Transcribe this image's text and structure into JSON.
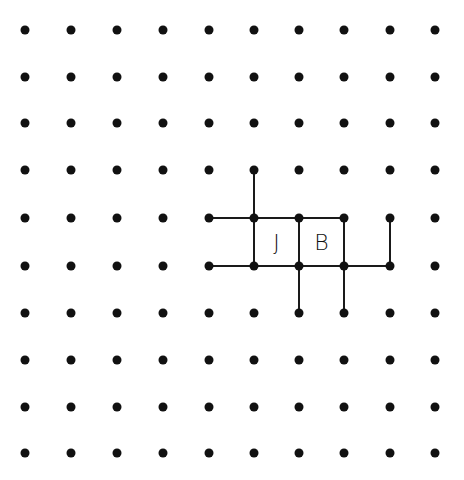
{
  "game": {
    "type": "dots-and-boxes",
    "grid": {
      "cols": 10,
      "rows": 10
    },
    "col_x": [
      25,
      71,
      117,
      163,
      209,
      254,
      299,
      344,
      390,
      435
    ],
    "row_y": [
      30,
      77,
      123,
      170,
      218,
      266,
      313,
      360,
      407,
      453
    ],
    "colors": {
      "dot": "#111111",
      "line": "#1a1a1a",
      "background": "#ffffff"
    },
    "lines": [
      {
        "orientation": "v",
        "col": 5,
        "row": 3
      },
      {
        "orientation": "h",
        "col": 4,
        "row": 4
      },
      {
        "orientation": "h",
        "col": 5,
        "row": 4
      },
      {
        "orientation": "h",
        "col": 6,
        "row": 4
      },
      {
        "orientation": "h",
        "col": 4,
        "row": 5
      },
      {
        "orientation": "h",
        "col": 5,
        "row": 5
      },
      {
        "orientation": "h",
        "col": 6,
        "row": 5
      },
      {
        "orientation": "h",
        "col": 7,
        "row": 5
      },
      {
        "orientation": "v",
        "col": 5,
        "row": 4
      },
      {
        "orientation": "v",
        "col": 6,
        "row": 4
      },
      {
        "orientation": "v",
        "col": 7,
        "row": 4
      },
      {
        "orientation": "v",
        "col": 8,
        "row": 4
      },
      {
        "orientation": "v",
        "col": 6,
        "row": 5
      },
      {
        "orientation": "v",
        "col": 7,
        "row": 5
      }
    ],
    "boxes": [
      {
        "col": 5,
        "row": 4,
        "owner": "J"
      },
      {
        "col": 6,
        "row": 4,
        "owner": "B"
      }
    ]
  }
}
